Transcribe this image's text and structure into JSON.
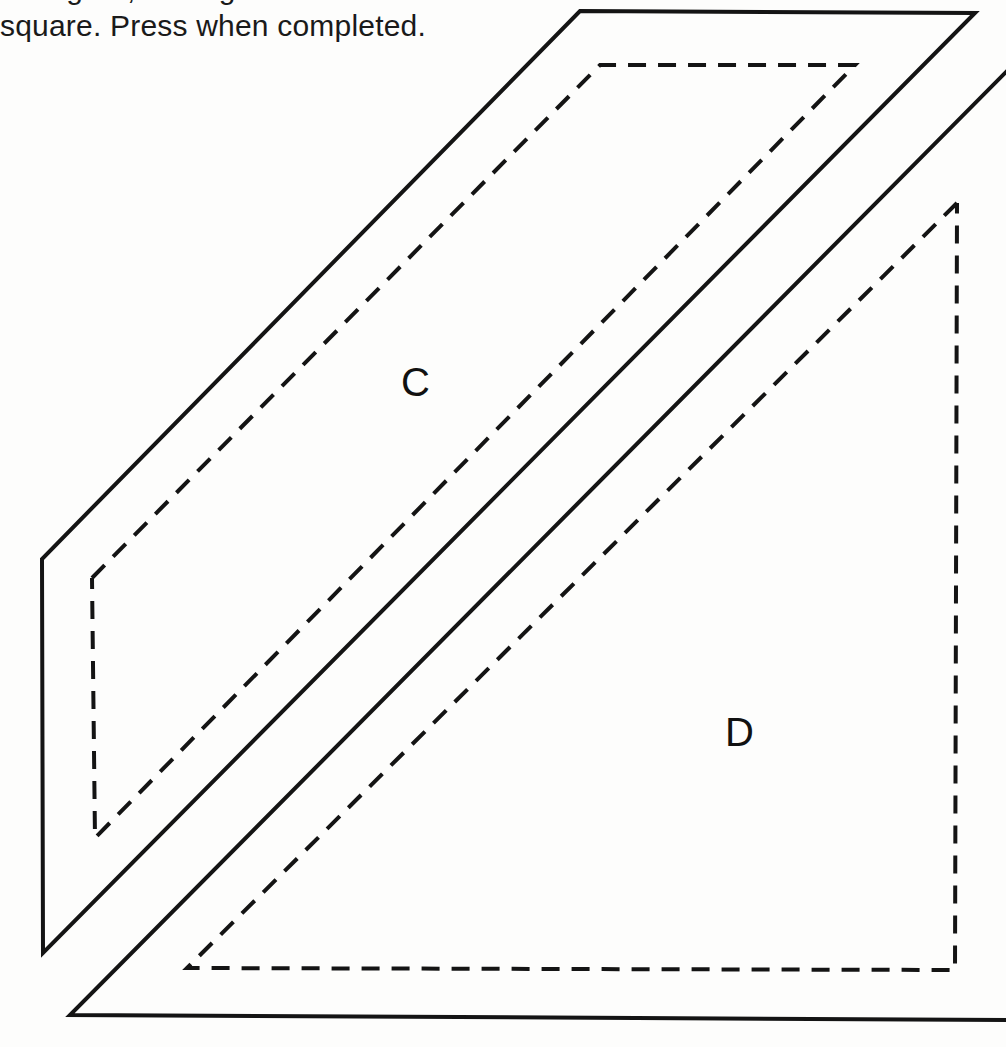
{
  "page": {
    "width": 1006,
    "height": 1047,
    "background_color": "#fdfdfc",
    "ink_color": "#141414"
  },
  "instructions": {
    "line_1_partial": "the figure, tracing a written",
    "line_2": "square. Press when completed."
  },
  "figure": {
    "stroke_color": "#141414",
    "solid_stroke_width": 4,
    "dashed_stroke_width": 4,
    "dash_pattern": "18 12",
    "labels": [
      {
        "id": "label-c",
        "text": "C",
        "x": 401,
        "y": 362
      },
      {
        "id": "label-d",
        "text": "D",
        "x": 725,
        "y": 712
      }
    ],
    "shapes": [
      {
        "name": "shape-c-solid-outline",
        "style": "solid",
        "closed": true,
        "points": "580,11 975,13 43,953 42,559"
      },
      {
        "name": "shape-c-dashed-outline",
        "style": "dashed",
        "closed": false,
        "points": "92,578 600,65 855,65 95,838 92,578"
      },
      {
        "name": "shape-d-solid-outline",
        "style": "solid",
        "closed": false,
        "points": "1006,72 70,1015 1006,1020"
      },
      {
        "name": "shape-d-dashed-outline",
        "style": "dashed",
        "closed": false,
        "points": "957,203 187,968 955,970 957,203"
      }
    ]
  }
}
